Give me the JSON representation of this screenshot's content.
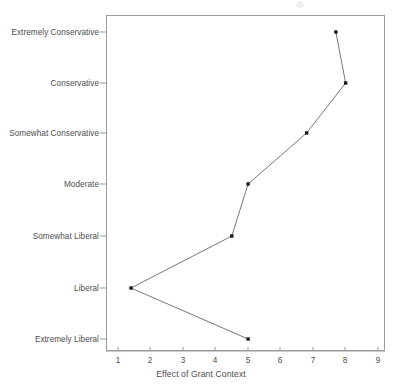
{
  "chart_data": {
    "type": "line",
    "title": "",
    "subtitle": "",
    "xlabel": "Effect of Grant Context",
    "ylabel": "",
    "orientation": "horizontal-categories",
    "grid": false,
    "legend": null,
    "xlim": [
      0.5,
      9.5
    ],
    "xticks": [
      1,
      2,
      3,
      4,
      5,
      6,
      7,
      8,
      9
    ],
    "xtick_labels": [
      "1",
      "2",
      "3",
      "4",
      "5",
      "6",
      "7",
      "8",
      "9"
    ],
    "categories": [
      "Extremely Conservative",
      "Conservative",
      "Somewhat Conservative",
      "Moderate",
      "Somewhat Liberal",
      "Liberal",
      "Extremely Liberal"
    ],
    "values": [
      7.7,
      8.0,
      6.8,
      5.0,
      4.5,
      1.4,
      5.0
    ],
    "marker": "filled-square",
    "marker_color": "#1a1a1a",
    "line_color": "#555555",
    "line_width": 0.8,
    "frame_color": "#9a9a9a",
    "text_color": "#4d4d4d",
    "background": "#ffffff"
  },
  "axes": {
    "x_title": "Effect of Grant Context",
    "x_tick_labels": [
      "1",
      "2",
      "3",
      "4",
      "5",
      "6",
      "7",
      "8",
      "9"
    ],
    "y_tick_labels": [
      "Extremely Conservative",
      "Conservative",
      "Somewhat Conservative",
      "Moderate",
      "Somewhat Liberal",
      "Liberal",
      "Extremely Liberal"
    ]
  }
}
